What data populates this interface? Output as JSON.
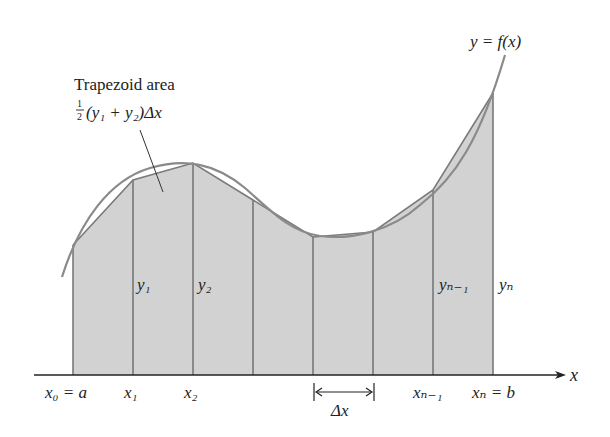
{
  "title_annotation": {
    "line1": "Trapezoid area",
    "formula_frac_num": "1",
    "formula_frac_den": "2",
    "formula_rest": "(y₁ + y₂)Δx"
  },
  "curve_label": "y = f(x)",
  "axis_label": "x",
  "x_labels": [
    {
      "id": "x0",
      "text": "x₀ = a"
    },
    {
      "id": "x1",
      "text": "x₁"
    },
    {
      "id": "x2",
      "text": "x₂"
    },
    {
      "id": "xn1",
      "text": "xₙ₋₁"
    },
    {
      "id": "xn",
      "text": "xₙ = b"
    }
  ],
  "y_labels": [
    {
      "id": "y1",
      "text": "y₁"
    },
    {
      "id": "y2",
      "text": "y₂"
    },
    {
      "id": "yn1",
      "text": "yₙ₋₁"
    },
    {
      "id": "yn",
      "text": "yₙ"
    }
  ],
  "delta_label": "Δx",
  "colors": {
    "fill": "#cfcfcf",
    "curve": "#8a8a8a",
    "edges": "#6e6e6e",
    "axis": "#222222"
  }
}
